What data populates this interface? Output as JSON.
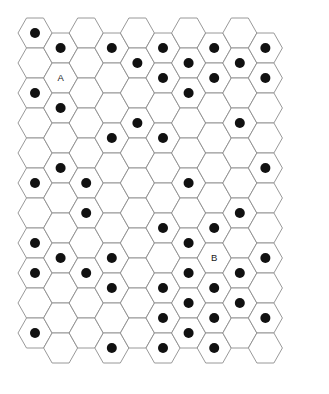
{
  "figure": {
    "type": "hex-grid",
    "background_color": "#ffffff",
    "hex_stroke_color": "#8d8d8d",
    "dot_color": "#111111",
    "label_color": "#1a1a1a"
  },
  "geometry": {
    "columns": 10,
    "rows_per_column": 11,
    "hex_width": 34,
    "hex_height": 30,
    "column_pitch": 25.6,
    "row_pitch": 30,
    "column_offset_y": 15,
    "origin_x": 35,
    "origin_y": 33,
    "dot_radius": 5.0,
    "orientation": "flat-top"
  },
  "labels": [
    {
      "text": "A",
      "col": 2,
      "row": 2
    },
    {
      "text": "B",
      "col": 8,
      "row": 8
    }
  ],
  "occupancy": {
    "description": "Per-column list of 1-based row indices containing a filled dot",
    "columns": [
      {
        "col": 1,
        "dot_rows": [
          1,
          3,
          6,
          8,
          9,
          11
        ]
      },
      {
        "col": 2,
        "dot_rows": [
          1,
          3,
          5,
          8
        ]
      },
      {
        "col": 3,
        "dot_rows": [
          6,
          7,
          9
        ]
      },
      {
        "col": 4,
        "dot_rows": [
          1,
          4,
          8,
          9,
          11
        ]
      },
      {
        "col": 5,
        "dot_rows": [
          2,
          4
        ]
      },
      {
        "col": 6,
        "dot_rows": [
          1,
          2,
          4,
          7,
          9,
          10,
          11
        ]
      },
      {
        "col": 7,
        "dot_rows": [
          2,
          3,
          6,
          8,
          9,
          10,
          11
        ]
      },
      {
        "col": 8,
        "dot_rows": [
          1,
          2,
          7,
          9,
          10,
          11
        ]
      },
      {
        "col": 9,
        "dot_rows": [
          2,
          4,
          7,
          9,
          10
        ]
      },
      {
        "col": 10,
        "dot_rows": [
          1,
          2,
          5,
          8,
          10
        ]
      }
    ]
  },
  "counts": {
    "total_cells": 110,
    "total_dots": 48,
    "labelled_cells": 2
  }
}
